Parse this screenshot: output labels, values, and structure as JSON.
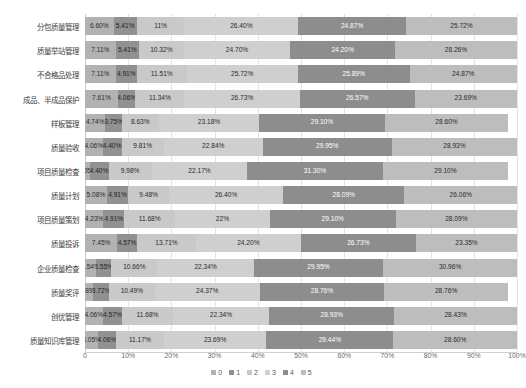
{
  "chart_data": {
    "type": "bar",
    "orientation": "horizontal",
    "stacked": true,
    "stack_mode": "percent",
    "title": "",
    "subtitle": "",
    "xlabel": "",
    "ylabel": "",
    "xlim": [
      0,
      100
    ],
    "grid": true,
    "grid_axis": "x",
    "legend_position": "bottom",
    "xticks": [
      "0",
      "10%",
      "20%",
      "30%",
      "40%",
      "50%",
      "60%",
      "70%",
      "80%",
      "90%",
      "100%"
    ],
    "xtick_values": [
      0,
      10,
      20,
      30,
      40,
      50,
      60,
      70,
      80,
      90,
      100
    ],
    "legend": [
      "0",
      "1",
      "2",
      "3",
      "4",
      "5"
    ],
    "colors": [
      "#b2b2b2",
      "#919191",
      "#c9c9c9",
      "#cfcfcf",
      "#8d8d8d",
      "#bdbdbd"
    ],
    "categories": [
      "分包质量管理",
      "质量举站管理",
      "不合格品处理",
      "成品、半成品保护",
      "样板管理",
      "质量验收",
      "项目质量检查",
      "质量计划",
      "项目质量策划",
      "质量投诉",
      "企业质量检查",
      "质量奖评",
      "创优管理",
      "质量知识库管理"
    ],
    "series": [
      {
        "name": "0",
        "values": [
          6.6,
          7.11,
          7.11,
          7.61,
          4.74,
          4.06,
          1.05,
          5.08,
          4.23,
          7.45,
          2.54,
          1.89,
          4.06,
          3.05
        ],
        "labels": [
          "6.60%",
          "7.11%",
          "7.11%",
          "7.61%",
          "4.74%",
          "4.06%",
          "1.05%",
          "5.08%",
          "4.23%",
          "7.45%",
          "2.54%",
          "1.89%",
          "4.06%",
          "3.05%"
        ]
      },
      {
        "name": "1",
        "values": [
          5.41,
          5.41,
          4.91,
          4.06,
          3.75,
          4.4,
          4.4,
          4.91,
          4.91,
          4.57,
          3.55,
          3.72,
          4.57,
          4.06
        ],
        "labels": [
          "5.41%",
          "5.41%",
          "4.91%",
          "4.06%",
          "3.75%",
          "4.40%",
          "4.40%",
          "4.91%",
          "4.91%",
          "4.57%",
          "3.55%",
          "3.72%",
          "4.57%",
          "4.06%"
        ]
      },
      {
        "name": "2",
        "values": [
          11.0,
          10.32,
          11.51,
          11.34,
          8.63,
          9.81,
          9.98,
          9.48,
          11.68,
          13.71,
          10.66,
          10.49,
          11.68,
          11.17
        ],
        "labels": [
          "11%",
          "10.32%",
          "11.51%",
          "11.34%",
          "8.63%",
          "9.81%",
          "9.98%",
          "9.48%",
          "11.68%",
          "13.71%",
          "10.66%",
          "10.49%",
          "11.68%",
          "11.17%"
        ]
      },
      {
        "name": "3",
        "values": [
          26.4,
          24.7,
          25.72,
          26.73,
          23.18,
          22.84,
          22.17,
          26.4,
          22.0,
          24.2,
          22.34,
          24.37,
          22.34,
          23.69
        ],
        "labels": [
          "26.40%",
          "24.70%",
          "25.72%",
          "26.73%",
          "23.18%",
          "22.84%",
          "22.17%",
          "26.40%",
          "22%",
          "24.20%",
          "22.34%",
          "24.37%",
          "22.34%",
          "23.69%"
        ]
      },
      {
        "name": "4",
        "values": [
          24.87,
          24.2,
          25.89,
          26.57,
          29.1,
          29.95,
          31.3,
          28.09,
          29.1,
          26.73,
          29.95,
          28.76,
          28.93,
          29.44
        ],
        "labels": [
          "24.87%",
          "24.20%",
          "25.89%",
          "26.57%",
          "29.10%",
          "29.95%",
          "31.30%",
          "28.09%",
          "29.10%",
          "26.73%",
          "29.95%",
          "28.76%",
          "28.93%",
          "29.44%"
        ]
      },
      {
        "name": "5",
        "values": [
          25.72,
          28.26,
          24.87,
          23.69,
          28.6,
          28.93,
          29.1,
          26.06,
          28.09,
          23.35,
          30.96,
          28.76,
          28.43,
          28.6
        ],
        "labels": [
          "25.72%",
          "28.26%",
          "24.87%",
          "23.69%",
          "28.60%",
          "28.93%",
          "29.10%",
          "26.06%",
          "28.09%",
          "23.35%",
          "30.96%",
          "28.76%",
          "28.43%",
          "28.60%"
        ]
      }
    ]
  }
}
